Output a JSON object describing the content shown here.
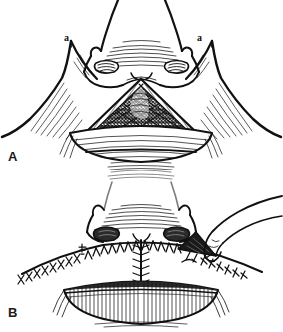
{
  "figure": {
    "background_color": "#ffffff",
    "ink_color": "#111111",
    "width": 283,
    "height": 332
  },
  "panels": [
    {
      "id": "A",
      "label": "A",
      "caption": "Triangular full-thickness defect of the nasal base and upper lip with bilateral cheek advancement flaps outlined",
      "annotations": [
        {
          "id": "a-left",
          "label": "a",
          "meaning": "left alar base point"
        },
        {
          "id": "a-right",
          "label": "a",
          "meaning": "right alar base point"
        }
      ],
      "structures": [
        "nasal-tip",
        "nasal-dorsum",
        "left-ala",
        "right-ala",
        "left-nostril",
        "right-nostril",
        "columella",
        "triangular-defect",
        "upper-lip-vermilion",
        "left-cheek-flap",
        "right-cheek-flap"
      ]
    },
    {
      "id": "B",
      "label": "B",
      "caption": "Completed closure with interrupted sutures along the alar base and philtral midline; residual Burow's triangle being excised at the right alar base",
      "annotations": [
        {
          "id": "a-left",
          "label": "a",
          "meaning": "left alar base point"
        },
        {
          "id": "a-right",
          "label": "a",
          "meaning": "right alar base point"
        }
      ],
      "structures": [
        "nasal-tip",
        "left-ala",
        "right-ala",
        "left-nostril",
        "right-nostril",
        "horizontal-suture-line",
        "vertical-philtral-suture-line",
        "left-nasolabial-suture-line",
        "right-nasolabial-suture-line",
        "burow-triangle",
        "forceps-hand",
        "upper-lip-vermilion"
      ]
    }
  ]
}
